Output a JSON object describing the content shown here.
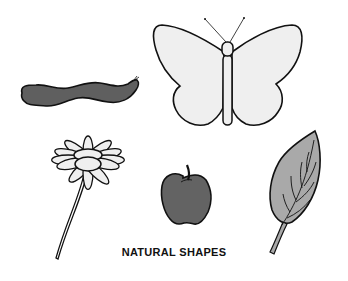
{
  "caption": "NATURAL SHAPES",
  "shapes": [
    {
      "name": "caterpillar",
      "fill": "#5f5f5f"
    },
    {
      "name": "butterfly",
      "fill": "#efefef"
    },
    {
      "name": "daisy",
      "fill": "#efefef"
    },
    {
      "name": "apple",
      "fill": "#636363"
    },
    {
      "name": "leaf",
      "fill": "#a9a9a9"
    }
  ],
  "colors": {
    "outline": "#111111",
    "background": "#ffffff"
  }
}
